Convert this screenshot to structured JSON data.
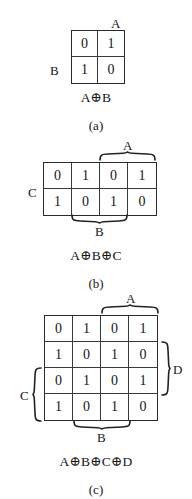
{
  "figures": [
    {
      "id": "a",
      "grid": {
        "rows": 2,
        "cols": 2,
        "values": [
          [
            "0",
            "1"
          ],
          [
            "1",
            "0"
          ]
        ]
      },
      "top_label": "A",
      "side_label": "B",
      "expression": "A⊕B",
      "caption": "(a)"
    },
    {
      "id": "b",
      "grid": {
        "rows": 2,
        "cols": 4,
        "values": [
          [
            "0",
            "1",
            "0",
            "1"
          ],
          [
            "1",
            "0",
            "1",
            "0"
          ]
        ]
      },
      "top_brace_label": "A",
      "bottom_brace_label": "B",
      "side_label": "C",
      "expression": "A⊕B⊕C",
      "caption": "(b)"
    },
    {
      "id": "c",
      "grid": {
        "rows": 4,
        "cols": 4,
        "values": [
          [
            "0",
            "1",
            "0",
            "1"
          ],
          [
            "1",
            "0",
            "1",
            "0"
          ],
          [
            "0",
            "1",
            "0",
            "1"
          ],
          [
            "1",
            "0",
            "1",
            "0"
          ]
        ]
      },
      "top_brace_label": "A",
      "bottom_brace_label": "B",
      "left_brace_label": "C",
      "right_brace_label": "D",
      "expression": "A⊕B⊕C⊕D",
      "caption": "(c)"
    }
  ]
}
